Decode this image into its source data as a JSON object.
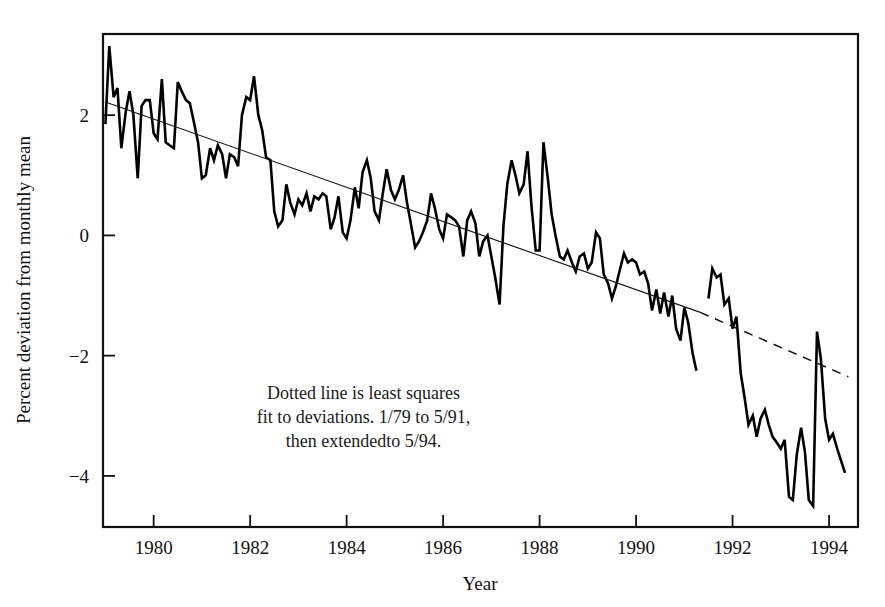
{
  "chart_data": {
    "type": "line",
    "title": "",
    "xlabel": "Year",
    "ylabel": "Percent deviation from monthly mean",
    "xlim": [
      1978.95,
      1994.6
    ],
    "ylim": [
      -4.85,
      3.35
    ],
    "xticks": [
      1980,
      1982,
      1984,
      1986,
      1988,
      1990,
      1992,
      1994
    ],
    "xtick_labels": [
      "1980",
      "1982",
      "1984",
      "1986",
      "1988",
      "1990",
      "1992",
      "1994"
    ],
    "yticks": [
      2,
      0,
      -2,
      -4
    ],
    "ytick_labels": [
      "2",
      "0",
      "−2",
      "−4"
    ],
    "grid": false,
    "legend": false,
    "annotations": [
      {
        "name": "least-squares-note",
        "lines": [
          "Dotted line is least squares",
          "fit to deviations. 1/79 to 5/91,",
          "then extendedto 5/94."
        ],
        "x": 1984.35,
        "y": -2.72,
        "align": "center"
      }
    ],
    "series": [
      {
        "name": "Percent deviation from monthly mean",
        "style": "solid",
        "color": "#000000",
        "linewidth": 2.6,
        "x": [
          1979.0,
          1979.08,
          1979.17,
          1979.25,
          1979.33,
          1979.42,
          1979.5,
          1979.58,
          1979.67,
          1979.75,
          1979.83,
          1979.92,
          1980.0,
          1980.08,
          1980.17,
          1980.25,
          1980.33,
          1980.42,
          1980.5,
          1980.58,
          1980.67,
          1980.75,
          1980.83,
          1980.92,
          1981.0,
          1981.08,
          1981.17,
          1981.25,
          1981.33,
          1981.42,
          1981.5,
          1981.58,
          1981.67,
          1981.75,
          1981.83,
          1981.92,
          1982.0,
          1982.08,
          1982.17,
          1982.25,
          1982.33,
          1982.42,
          1982.5,
          1982.58,
          1982.67,
          1982.75,
          1982.83,
          1982.92,
          1983.0,
          1983.08,
          1983.17,
          1983.25,
          1983.33,
          1983.42,
          1983.5,
          1983.58,
          1983.67,
          1983.75,
          1983.83,
          1983.92,
          1984.0,
          1984.08,
          1984.17,
          1984.25,
          1984.33,
          1984.42,
          1984.5,
          1984.58,
          1984.67,
          1984.75,
          1984.83,
          1984.92,
          1985.0,
          1985.08,
          1985.17,
          1985.25,
          1985.33,
          1985.42,
          1985.5,
          1985.58,
          1985.67,
          1985.75,
          1985.83,
          1985.92,
          1986.0,
          1986.08,
          1986.17,
          1986.25,
          1986.33,
          1986.42,
          1986.5,
          1986.58,
          1986.67,
          1986.75,
          1986.83,
          1986.92,
          1987.0,
          1987.08,
          1987.17,
          1987.25,
          1987.33,
          1987.42,
          1987.5,
          1987.58,
          1987.67,
          1987.75,
          1987.83,
          1987.92,
          1988.0,
          1988.08,
          1988.17,
          1988.25,
          1988.33,
          1988.42,
          1988.5,
          1988.58,
          1988.67,
          1988.75,
          1988.83,
          1988.92,
          1989.0,
          1989.08,
          1989.17,
          1989.25,
          1989.33,
          1989.42,
          1989.5,
          1989.58,
          1989.67,
          1989.75,
          1989.83,
          1989.92,
          1990.0,
          1990.08,
          1990.17,
          1990.25,
          1990.33,
          1990.42,
          1990.5,
          1990.58,
          1990.67,
          1990.75,
          1990.83,
          1990.92,
          1991.0,
          1991.08,
          1991.17,
          1991.25
        ],
        "y": [
          1.85,
          3.15,
          2.3,
          2.45,
          1.45,
          2.05,
          2.4,
          2.0,
          0.95,
          2.15,
          2.25,
          2.25,
          1.7,
          1.6,
          2.6,
          1.55,
          1.5,
          1.45,
          2.55,
          2.4,
          2.25,
          2.2,
          1.9,
          1.55,
          0.95,
          1.0,
          1.45,
          1.25,
          1.5,
          1.35,
          0.95,
          1.35,
          1.3,
          1.15,
          2.0,
          2.3,
          2.25,
          2.65,
          2.0,
          1.75,
          1.3,
          1.25,
          0.4,
          0.15,
          0.25,
          0.85,
          0.55,
          0.35,
          0.6,
          0.5,
          0.7,
          0.4,
          0.65,
          0.6,
          0.7,
          0.65,
          0.1,
          0.3,
          0.65,
          0.05,
          -0.05,
          0.25,
          0.8,
          0.45,
          1.05,
          1.25,
          0.95,
          0.4,
          0.25,
          0.7,
          1.1,
          0.75,
          0.6,
          0.75,
          1.0,
          0.55,
          0.2,
          -0.2,
          -0.1,
          0.05,
          0.25,
          0.7,
          0.45,
          0.1,
          -0.05,
          0.35,
          0.3,
          0.25,
          0.15,
          -0.35,
          0.25,
          0.4,
          0.2,
          -0.35,
          -0.1,
          0.0,
          -0.35,
          -0.7,
          -1.15,
          0.15,
          0.85,
          1.25,
          1.0,
          0.7,
          0.85,
          1.4,
          0.5,
          -0.25,
          -0.25,
          1.55,
          0.95,
          0.35,
          0.0,
          -0.35,
          -0.4,
          -0.25,
          -0.45,
          -0.6,
          -0.35,
          -0.3,
          -0.55,
          -0.45,
          0.05,
          -0.05,
          -0.65,
          -0.8,
          -1.05,
          -0.85,
          -0.55,
          -0.3,
          -0.45,
          -0.4,
          -0.45,
          -0.65,
          -0.6,
          -0.8,
          -1.25,
          -0.9,
          -1.3,
          -0.95,
          -1.35,
          -1.0,
          -1.55,
          -1.75,
          -1.2,
          -1.45,
          -1.95,
          -2.25
        ]
      },
      {
        "name": "Percent deviation (continued)",
        "style": "solid",
        "color": "#000000",
        "linewidth": 2.6,
        "x": [
          1991.5,
          1991.58,
          1991.67,
          1991.75,
          1991.83,
          1991.92,
          1992.0,
          1992.08,
          1992.17,
          1992.25,
          1992.33,
          1992.42,
          1992.5,
          1992.58,
          1992.67,
          1992.75,
          1992.83,
          1992.92,
          1993.0,
          1993.08,
          1993.17,
          1993.25,
          1993.33,
          1993.42,
          1993.5,
          1993.58,
          1993.67,
          1993.75,
          1993.83,
          1993.92,
          1994.0,
          1994.08,
          1994.17,
          1994.25,
          1994.33
        ],
        "y": [
          -1.05,
          -0.55,
          -0.7,
          -0.65,
          -1.15,
          -1.05,
          -1.55,
          -1.35,
          -2.3,
          -2.7,
          -3.15,
          -3.0,
          -3.35,
          -3.05,
          -2.9,
          -3.15,
          -3.35,
          -3.45,
          -3.55,
          -3.4,
          -4.35,
          -4.4,
          -3.65,
          -3.2,
          -3.6,
          -4.4,
          -4.5,
          -1.6,
          -2.05,
          -3.05,
          -3.4,
          -3.3,
          -3.55,
          -3.75,
          -3.95
        ]
      },
      {
        "name": "Least squares fit 1/79 to 5/91",
        "style": "solid",
        "color": "#111111",
        "linewidth": 1.1,
        "x": [
          1979.0,
          1991.33
        ],
        "y": [
          2.22,
          -1.28
        ]
      },
      {
        "name": "Least squares fit extended to 5/94",
        "style": "dashed",
        "color": "#111111",
        "linewidth": 1.5,
        "dash": "9 7",
        "x": [
          1991.33,
          1994.4
        ],
        "y": [
          -1.28,
          -2.35
        ]
      }
    ]
  },
  "axes": {
    "y_axis_title": "Percent deviation from monthly mean",
    "x_axis_title": "Year"
  }
}
